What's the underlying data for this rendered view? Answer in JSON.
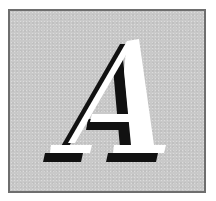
{
  "image": {
    "letter": "A",
    "colors": {
      "background": "#c9c9c9",
      "border": "#6e6e6e",
      "letter_fill": "#ffffff",
      "letter_shadow": "#111111"
    }
  }
}
